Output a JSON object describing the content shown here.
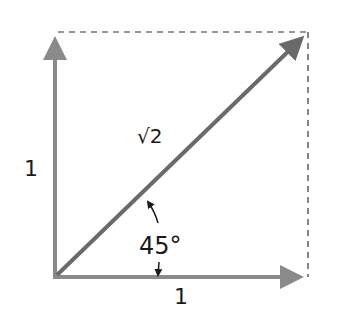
{
  "diagram": {
    "type": "vector-diagram",
    "colors": {
      "axis_vectors": "#8a8a8a",
      "diagonal_vector": "#6a6a6a",
      "dashed_lines": "#333333",
      "text": "#1a1a1a",
      "background": "#ffffff"
    },
    "labels": {
      "vertical_side": "1",
      "horizontal_side": "1",
      "diagonal": "√2",
      "angle": "45°"
    },
    "geometry": {
      "origin": [
        55,
        277
      ],
      "vertical_tip": [
        55,
        32
      ],
      "horizontal_tip": [
        308,
        277
      ],
      "diagonal_tip": [
        308,
        32
      ],
      "angle_degrees": 45
    }
  }
}
